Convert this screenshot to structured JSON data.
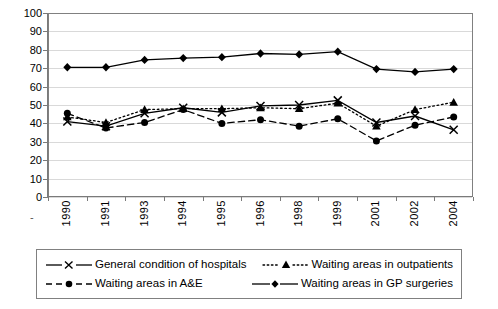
{
  "chart_data": {
    "type": "line",
    "title": "",
    "xlabel": "",
    "ylabel": "",
    "ylim": [
      0,
      100
    ],
    "ytick_step": 10,
    "grid": true,
    "legend_position": "bottom",
    "categories": [
      "1990",
      "1991",
      "1993",
      "1994",
      "1995",
      "1996",
      "1998",
      "1999",
      "2001",
      "2002",
      "2004"
    ],
    "yticks": [
      "100",
      "90",
      "80",
      "70",
      "60",
      "50",
      "40",
      "30",
      "20",
      "10",
      "0"
    ],
    "series": [
      {
        "name": "General condition of hospitals",
        "marker": "x",
        "line_style": "solid",
        "color": "#000000",
        "values": [
          41,
          38.5,
          45.5,
          48.5,
          46,
          49.5,
          50,
          52.5,
          40.5,
          44,
          36.5
        ]
      },
      {
        "name": "Waiting areas in outpatients",
        "marker": "triangle",
        "line_style": "dotted",
        "color": "#000000",
        "values": [
          43.5,
          40.5,
          47.5,
          48,
          48,
          48.5,
          48,
          51,
          38.5,
          47.5,
          51.5
        ]
      },
      {
        "name": "Waiting areas in A&E",
        "marker": "circle",
        "line_style": "dashed",
        "color": "#000000",
        "values": [
          45.5,
          37.5,
          40.5,
          47.5,
          40,
          42,
          38.5,
          42.5,
          30.5,
          39,
          43.5
        ]
      },
      {
        "name": "Waiting areas in GP surgeries",
        "marker": "diamond",
        "line_style": "solid",
        "color": "#000000",
        "values": [
          70.5,
          70.5,
          74.5,
          75.5,
          76,
          78,
          77.5,
          79,
          69.5,
          68,
          69.5
        ]
      }
    ]
  },
  "legend": {
    "entries": [
      {
        "label": "General condition of hospitals"
      },
      {
        "label": "Waiting areas in outpatients"
      },
      {
        "label": "Waiting areas in A&E"
      },
      {
        "label": "Waiting areas in GP surgeries"
      }
    ]
  },
  "axis": {
    "x_stub": "-"
  }
}
